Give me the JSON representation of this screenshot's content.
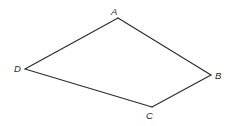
{
  "diagram": {
    "type": "quadrilateral",
    "width": 233,
    "height": 126,
    "stroke_color": "#2a2a2a",
    "vertices": [
      {
        "label": "A",
        "x": 118,
        "y": 18,
        "label_x": 111,
        "label_y": 15
      },
      {
        "label": "B",
        "x": 211,
        "y": 75,
        "label_x": 215,
        "label_y": 79
      },
      {
        "label": "C",
        "x": 152,
        "y": 107,
        "label_x": 146,
        "label_y": 119
      },
      {
        "label": "D",
        "x": 25,
        "y": 69,
        "label_x": 14,
        "label_y": 72
      }
    ],
    "edges": [
      {
        "from": "A",
        "to": "B"
      },
      {
        "from": "B",
        "to": "C"
      },
      {
        "from": "C",
        "to": "D"
      },
      {
        "from": "D",
        "to": "A"
      }
    ]
  }
}
